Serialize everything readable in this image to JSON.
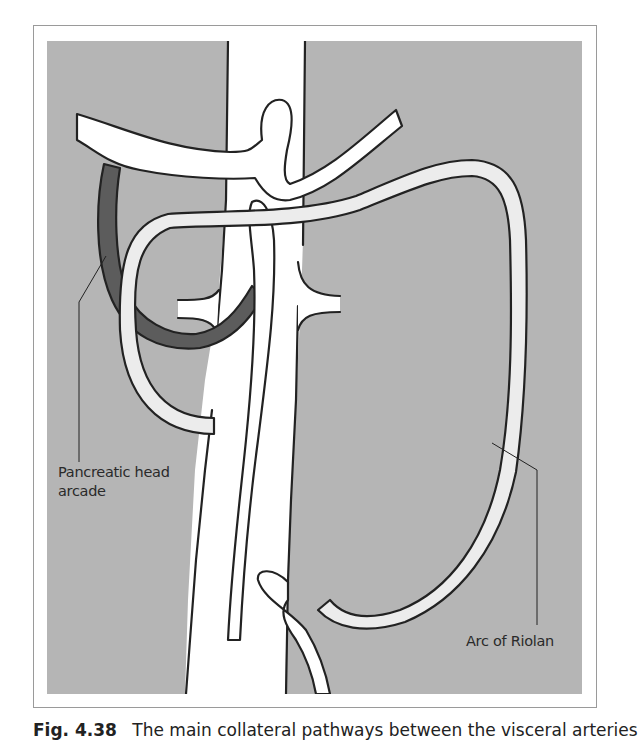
{
  "figure": {
    "background_color": "#b5b5b5",
    "vessel_fill": "#ffffff",
    "arc_fill": "#ececec",
    "arcade_fill": "#5c5c5c",
    "outline_color": "#222222",
    "labels": {
      "pancreatic_head_arcade": [
        "Pancreatic head",
        "arcade"
      ],
      "arc_of_riolan": "Arc of Riolan"
    },
    "structures": [
      "aorta",
      "celiac-trunk",
      "superior-mesenteric-artery",
      "renal-arteries",
      "inferior-mesenteric-artery",
      "pancreatic-head-arcade",
      "arc-of-riolan"
    ]
  },
  "caption": {
    "number": "Fig. 4.38",
    "text": "The main collateral pathways between the visceral arteries"
  }
}
